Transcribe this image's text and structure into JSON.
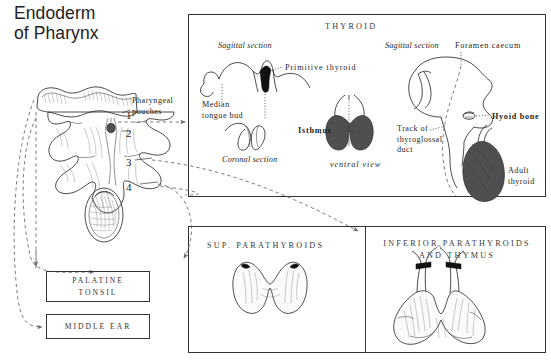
{
  "page": {
    "title": "Endoderm\nof Pharynx",
    "background": "#ffffff",
    "ink_color": "#2a2a2a",
    "dash_color": "#6e6e6e"
  },
  "left_column": {
    "pouches_label": "Pharyngeal\npouches",
    "pouch_numbers": [
      "1",
      "2",
      "3",
      "4"
    ],
    "outcome_boxes": [
      {
        "name": "palatine-tonsil",
        "label": "PALATINE\nTONSIL"
      },
      {
        "name": "middle-ear",
        "label": "MIDDLE EAR"
      }
    ]
  },
  "panels": [
    {
      "id": "thyroid",
      "heading": "THYROID",
      "labels": {
        "sagittal_left": "Sagittal section",
        "primitive_thyroid": "Primitive thyroid",
        "median_tongue_bud": "Median\ntongue bud",
        "coronal_section": "Coronal section",
        "isthmus": "Isthmus",
        "ventral_view": "ventral  view",
        "sagittal_right": "Sagittal section",
        "foramen_caecum": "Foramen caecum",
        "hyoid_bone": "Hyoid bone",
        "track_of_duct": "Track of\nthyroglossal\nduct",
        "adult_thyroid": "Adult\nthyroid"
      }
    },
    {
      "id": "sup-parathyroids",
      "heading": "SUP. PARATHYROIDS"
    },
    {
      "id": "inf-parathyroids-thymus",
      "heading": "INFERIOR  PARATHYROIDS\nAND  THYMUS"
    }
  ]
}
